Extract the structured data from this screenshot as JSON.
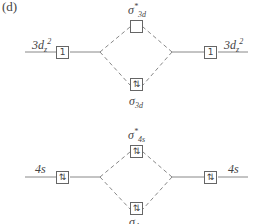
{
  "panel_label": "(d)",
  "diagrams": [
    {
      "name": "3d",
      "left_ao": {
        "label_main": "3d",
        "label_sub": "z",
        "label_sup": "2",
        "electrons": "1"
      },
      "right_ao": {
        "label_main": "3d",
        "label_sub": "z",
        "label_sup": "2",
        "electrons": "1"
      },
      "antibonding": {
        "label_sym": "σ",
        "label_star": "*",
        "label_sub": "3d",
        "electrons": ""
      },
      "bonding": {
        "label_sym": "σ",
        "label_sub": "3d",
        "electrons": "⇅"
      }
    },
    {
      "name": "4s",
      "left_ao": {
        "label_main": "4s",
        "electrons": "⇅"
      },
      "right_ao": {
        "label_main": "4s",
        "electrons": "⇅"
      },
      "antibonding": {
        "label_sym": "σ",
        "label_star": "*",
        "label_sub": "4s",
        "electrons": "⇅"
      },
      "bonding": {
        "label_sym": "σ",
        "label_sub": "4s",
        "electrons": "⇅"
      }
    }
  ],
  "colors": {
    "line": "#777777",
    "text": "#444444",
    "box_border": "#666666"
  }
}
